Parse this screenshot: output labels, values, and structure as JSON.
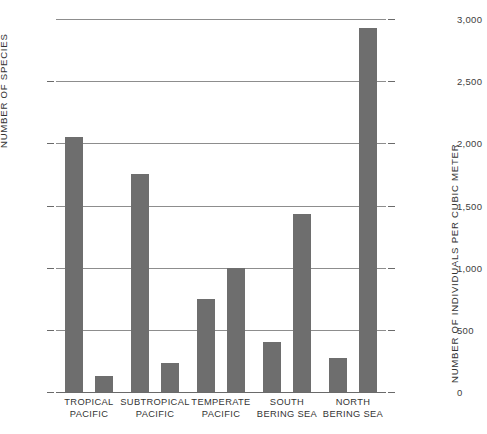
{
  "chart_data": {
    "type": "bar",
    "title": "",
    "xlabel": "",
    "categories": [
      "TROPICAL PACIFIC",
      "SUBTROPICAL PACIFIC",
      "TEMPERATE PACIFIC",
      "SOUTH BERING SEA",
      "NORTH BERING SEA"
    ],
    "category_lines": [
      [
        "TROPICAL",
        "PACIFIC"
      ],
      [
        "SUBTROPICAL",
        "PACIFIC"
      ],
      [
        "TEMPERATE",
        "PACIFIC"
      ],
      [
        "SOUTH",
        "BERING SEA"
      ],
      [
        "NORTH",
        "BERING SEA"
      ]
    ],
    "grid": true,
    "legend_position": "none",
    "bar_color": "#6e6e6e",
    "series": [
      {
        "name": "NUMBER OF SPECIES",
        "axis": "left",
        "ylabel": "NUMBER OF SPECIES",
        "ylim": [
          0,
          120
        ],
        "ticks": [
          0,
          20,
          40,
          60,
          80,
          100
        ],
        "tick_labels": [
          "0",
          "20",
          "40",
          "60",
          "80",
          "100"
        ],
        "values": [
          82,
          70,
          30,
          16,
          11
        ]
      },
      {
        "name": "NUMBER OF INDIVIDUALS PER CUBIC METER",
        "axis": "right",
        "ylabel": "NUMBER OF INDIVIDUALS PER CUBIC METER",
        "ylim": [
          0,
          3000
        ],
        "ticks": [
          0,
          500,
          1000,
          1500,
          2000,
          2500,
          3000
        ],
        "tick_labels": [
          "0",
          "500",
          "1,000",
          "1,500",
          "2,000",
          "2,500",
          "3,000"
        ],
        "values": [
          130,
          230,
          1000,
          1430,
          2930
        ]
      }
    ]
  }
}
